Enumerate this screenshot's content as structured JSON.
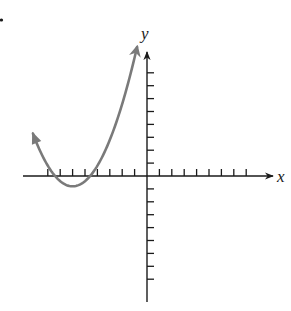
{
  "figure": {
    "x_axis_label": "x",
    "y_axis_label": "y",
    "marker_dot": "•"
  },
  "colors": {
    "axis": "#1a1a1a",
    "curve": "#7a7a7a",
    "background": "#ffffff"
  },
  "axes": {
    "origin_px": [
      147,
      176
    ],
    "unit_px_x": 12.4,
    "unit_px_y": 12.9,
    "x_ticks": [
      -8,
      -7,
      -6,
      -5,
      -4,
      -3,
      -2,
      -1,
      1,
      2,
      3,
      4,
      5,
      6,
      7,
      8
    ],
    "y_ticks": [
      -8,
      -7,
      -6,
      -5,
      -4,
      -3,
      -2,
      -1,
      1,
      2,
      3,
      4,
      5,
      6,
      7,
      8
    ],
    "x_range": [
      -9.8,
      10
    ],
    "y_range": [
      -9.7,
      9.6
    ]
  },
  "curve": {
    "type": "parabola",
    "opens": "up",
    "vertex": [
      -6,
      -0.8
    ],
    "x_intercepts": [
      -7.4,
      -4.6
    ],
    "endpoints_with_arrows": [
      [
        -9.2,
        4.1
      ],
      [
        -0.8,
        10
      ]
    ]
  }
}
